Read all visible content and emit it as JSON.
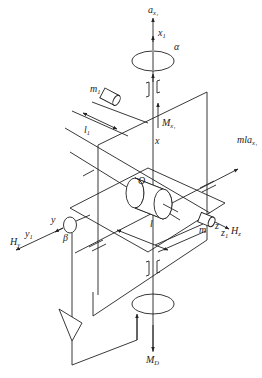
{
  "diagram": {
    "type": "mechanical gyroscope / accelerometer schematic (isometric)",
    "labels": {
      "a_x1": {
        "main": "a",
        "sub": "x₁"
      },
      "x1": {
        "main": "x",
        "sub": "1"
      },
      "alpha": "α",
      "m1": {
        "main": "m",
        "sub": "1"
      },
      "l1": {
        "main": "l",
        "sub": "1"
      },
      "M_x1": {
        "main": "M",
        "sub": "x₁"
      },
      "x": "x",
      "mla_x1": {
        "main": "mla",
        "sub": "x₁"
      },
      "O": "O",
      "y": "y",
      "y1": {
        "main": "y",
        "sub": "1"
      },
      "H_y": {
        "main": "H",
        "sub": "y"
      },
      "beta": "β",
      "l": "l",
      "m": "m",
      "z": "z",
      "z1": {
        "main": "z",
        "sub": "1"
      },
      "H_z": {
        "main": "H",
        "sub": "z"
      },
      "M_D": {
        "main": "M",
        "sub": "D"
      }
    },
    "components": [
      "vertical output axis x/x1 with acceleration arrow a_x1",
      "upper angle pickup ellipse (alpha)",
      "upper bearing pair",
      "pendulous mass m1 at arm l1",
      "inner gimbal frame (vertical plane)",
      "horizontal gimbal plane",
      "gyro rotor cylinder centered at O",
      "spin axis y/y1 with angular momentum H_y and pickoff beta",
      "axis z/z1 with H_z and mass m at arm l",
      "amplifier triangle in feedback loop",
      "lower torquer ellipse with output torque M_D"
    ]
  }
}
